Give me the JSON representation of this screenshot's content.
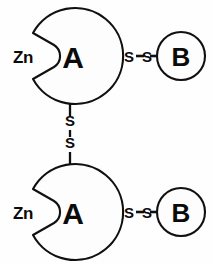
{
  "figure": {
    "background_color": "#fefefe",
    "stroke_color": "#101010",
    "fill_color": "#fdfdfd"
  },
  "units": [
    {
      "id": "top",
      "domain_a_label": "A",
      "metal_label": "Zn",
      "domain_b_label": "B",
      "interchain_link": {
        "left_sulfur": "S",
        "right_sulfur": "S",
        "dash_left": "-",
        "dash_mid": "-",
        "dash_right": "-"
      }
    },
    {
      "id": "bottom",
      "domain_a_label": "A",
      "metal_label": "Zn",
      "domain_b_label": "B",
      "interchain_link": {
        "left_sulfur": "S",
        "right_sulfur": "S",
        "dash_left": "-",
        "dash_mid": "-",
        "dash_right": "-"
      }
    }
  ],
  "bridge": {
    "upper_sulfur": "S",
    "lower_sulfur": "S",
    "bond_symbol": "-",
    "description": "vertical disulfide bridge connecting the two A domains"
  }
}
